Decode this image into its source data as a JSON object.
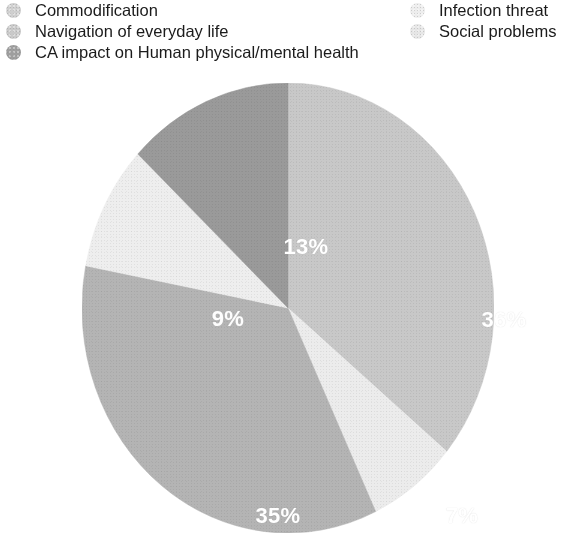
{
  "legend": {
    "columns": [
      {
        "items": [
          {
            "label": "Commodification",
            "color": "#cfcfcf",
            "icon": "legend-swatch-circle"
          },
          {
            "label": "Navigation of everyday life",
            "color": "#c9c9c9",
            "icon": "legend-swatch-circle"
          },
          {
            "label": "CA impact on Human physical/mental health",
            "color": "#9e9e9e",
            "icon": "legend-swatch-circle"
          }
        ]
      },
      {
        "items": [
          {
            "label": "Infection threat",
            "color": "#ededed",
            "icon": "legend-swatch-circle"
          },
          {
            "label": "Social problems",
            "color": "#e6e6e6",
            "icon": "legend-swatch-circle"
          }
        ]
      }
    ]
  },
  "chart_data": {
    "type": "pie",
    "title": "",
    "subtitle": "",
    "xlabel": "",
    "ylabel": "",
    "legend_position": "top",
    "grid": false,
    "start_angle_deg": 0,
    "direction": "clockwise",
    "units": "percent",
    "total": 100,
    "categories": [
      "Commodification",
      "Infection threat",
      "CA impact on Human physical/mental health",
      "Social problems",
      "Navigation of everyday life"
    ],
    "values": [
      36,
      7,
      35,
      9,
      13
    ],
    "labels": [
      "36%",
      "7%",
      "35%",
      "9%",
      "13%"
    ],
    "colors": [
      "#c8c8c8",
      "#ececec",
      "#b4b4b4",
      "#eeeeee",
      "#9a9a9a"
    ],
    "slices": [
      {
        "label": "36%",
        "value": 36,
        "category": "Commodification",
        "color": "#c8c8c8",
        "label_x": 422,
        "label_y": 237
      },
      {
        "label": "7%",
        "value": 7,
        "category": "Infection threat",
        "color": "#ececec",
        "label_x": 380,
        "label_y": 433
      },
      {
        "label": "35%",
        "value": 35,
        "category": "CA impact on Human physical/mental health",
        "color": "#b4b4b4",
        "label_y": 433,
        "label_x": 196
      },
      {
        "label": "9%",
        "value": 9,
        "category": "Social problems",
        "color": "#eeeeee",
        "label_x": 146,
        "label_y": 236
      },
      {
        "label": "13%",
        "value": 13,
        "category": "Navigation of everyday life",
        "color": "#9a9a9a",
        "label_x": 224,
        "label_y": 164
      }
    ]
  }
}
